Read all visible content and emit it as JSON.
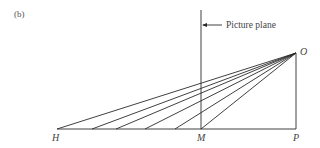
{
  "figure": {
    "panel_label": "(b)",
    "annotation": "Picture plane",
    "points": {
      "O": {
        "label": "O",
        "x": 296,
        "y": 53
      },
      "H": {
        "label": "H",
        "x": 57,
        "y": 129
      },
      "M": {
        "label": "M",
        "x": 201,
        "y": 129
      },
      "P": {
        "label": "P",
        "x": 296,
        "y": 129
      }
    },
    "ray_endpoints_x": [
      57,
      92,
      116,
      145,
      175,
      201
    ],
    "line_color": "#2a2a2a"
  }
}
